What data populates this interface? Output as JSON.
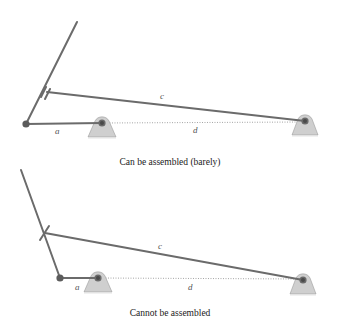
{
  "diagrams": [
    {
      "id": "top",
      "caption": "Can be assembled (barely)",
      "labels": {
        "a": "a",
        "c": "c",
        "d": "d"
      },
      "state": "assemblable"
    },
    {
      "id": "bottom",
      "caption": "Cannot be assembled",
      "labels": {
        "a": "a",
        "c": "c",
        "d": "d"
      },
      "state": "not-assemblable"
    }
  ],
  "colors": {
    "link": "#6b6b6b",
    "support_fill": "#cfcfcf",
    "pin": "#4a4a4a",
    "text": "#1a1a1a",
    "label": "#555555"
  }
}
